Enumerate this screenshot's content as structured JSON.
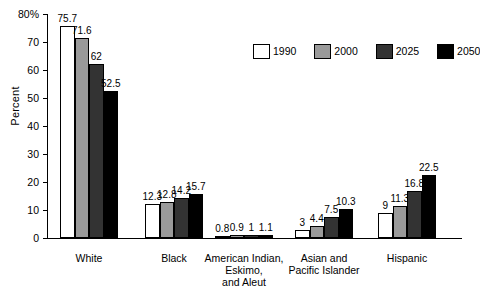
{
  "chart_data": {
    "type": "bar",
    "title": "",
    "subtitle": "",
    "xlabel": "",
    "ylabel": "Percent",
    "ylim": [
      0,
      80
    ],
    "ytick_values": [
      0,
      10,
      20,
      30,
      40,
      50,
      60,
      70,
      80
    ],
    "ytick_labels": [
      "0",
      "10",
      "20",
      "30",
      "40",
      "50",
      "60",
      "70",
      "80%"
    ],
    "grid": false,
    "legend_position": "top-right",
    "categories": [
      "White",
      "Black",
      "American Indian,\nEskimo,\nand Aleut",
      "Asian and\nPacific Islander",
      "Hispanic"
    ],
    "series": [
      {
        "name": "1990",
        "color": "#ffffff",
        "values": [
          75.7,
          12.3,
          0.8,
          3,
          9
        ],
        "value_labels": [
          "75.7",
          "12.3",
          "0.8",
          "3",
          "9"
        ]
      },
      {
        "name": "2000",
        "color": "#9a9a9a",
        "values": [
          71.6,
          12.8,
          0.9,
          4.4,
          11.3
        ],
        "value_labels": [
          "71.6",
          "12.8",
          "0.9",
          "4.4",
          "11.3"
        ]
      },
      {
        "name": "2025",
        "color": "#333333",
        "values": [
          62,
          14.2,
          1,
          7.5,
          16.8
        ],
        "value_labels": [
          "62",
          "14.2",
          "1",
          "7.5",
          "16.8"
        ]
      },
      {
        "name": "2050",
        "color": "#000000",
        "values": [
          52.5,
          15.7,
          1.1,
          10.3,
          22.5
        ],
        "value_labels": [
          "52.5",
          "15.7",
          "1.1",
          "10.3",
          "22.5"
        ]
      }
    ]
  },
  "axis": {
    "color": "#000000"
  }
}
